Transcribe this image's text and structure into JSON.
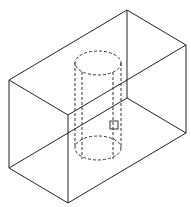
{
  "figure": {
    "colors": {
      "background": "#ffffff",
      "stroke": "#222222",
      "hidden_stroke": "#333333"
    }
  },
  "box": {
    "vertices": {
      "top_back": [
        127,
        10
      ],
      "top_right": [
        186,
        45
      ],
      "top_left": [
        9,
        80
      ],
      "top_front": [
        68,
        115
      ],
      "bottom_back": [
        127,
        98
      ],
      "bottom_right": [
        186,
        133
      ],
      "bottom_left": [
        9,
        168
      ],
      "bottom_front": [
        68,
        203
      ]
    }
  },
  "cylinder": {
    "top_center": [
      98,
      63
    ],
    "bottom_center": [
      98,
      148
    ],
    "rx": 23,
    "ry": 12,
    "inner_lines_x": [
      82,
      113
    ]
  },
  "marker": {
    "x": 110,
    "y": 121,
    "size": 8
  }
}
